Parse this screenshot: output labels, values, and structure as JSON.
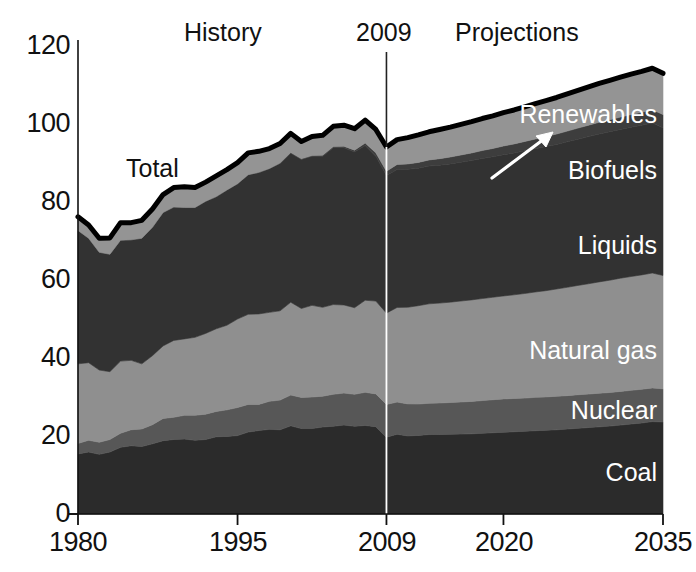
{
  "chart_data": {
    "type": "area",
    "title": "",
    "subtitle": "",
    "xlabel": "",
    "ylabel": "",
    "xlim": [
      1980,
      2035
    ],
    "ylim": [
      0,
      120
    ],
    "grid": false,
    "legend_position": "in-plot-right",
    "stacked": true,
    "x_ticks": [
      "1980",
      "1995",
      "2009",
      "2020",
      "2035"
    ],
    "x_tick_values": [
      1980,
      1995,
      2009,
      2020,
      2035
    ],
    "y_ticks": [
      "0",
      "20",
      "40",
      "60",
      "80",
      "100",
      "120"
    ],
    "y_tick_values": [
      0,
      20,
      40,
      60,
      80,
      100,
      120
    ],
    "annotations": [
      {
        "text": "History",
        "x": 1993,
        "y": 118
      },
      {
        "text": "2009",
        "x": 2009,
        "y": 118
      },
      {
        "text": "Projections",
        "x": 2020,
        "y": 118
      },
      {
        "text": "Total",
        "x": 1992,
        "y": 85
      }
    ],
    "divider_year": 2009,
    "series_order_bottom_to_top": [
      "Coal",
      "Nuclear",
      "Natural gas",
      "Liquids",
      "Biofuels",
      "Renewables"
    ],
    "x": [
      1980,
      1981,
      1982,
      1983,
      1984,
      1985,
      1986,
      1987,
      1988,
      1989,
      1990,
      1991,
      1992,
      1993,
      1994,
      1995,
      1996,
      1997,
      1998,
      1999,
      2000,
      2001,
      2002,
      2003,
      2004,
      2005,
      2006,
      2007,
      2008,
      2009,
      2010,
      2011,
      2012,
      2013,
      2014,
      2015,
      2016,
      2017,
      2018,
      2019,
      2020,
      2021,
      2022,
      2023,
      2024,
      2025,
      2026,
      2027,
      2028,
      2029,
      2030,
      2031,
      2032,
      2033,
      2034,
      2035
    ],
    "series": [
      {
        "name": "Coal",
        "color": "#2b2b2b",
        "values": [
          15.4,
          15.9,
          15.3,
          15.9,
          17.1,
          17.5,
          17.3,
          18.0,
          18.8,
          19.1,
          19.2,
          18.9,
          19.1,
          19.8,
          19.9,
          20.1,
          21.0,
          21.4,
          21.7,
          21.6,
          22.6,
          21.9,
          21.9,
          22.3,
          22.5,
          22.8,
          22.5,
          22.7,
          22.4,
          19.7,
          20.8,
          20.2,
          20.3,
          20.6,
          20.7,
          20.8,
          20.9,
          21.0,
          21.2,
          21.4,
          21.6,
          21.8,
          22.0,
          22.2,
          22.4,
          22.6,
          22.9,
          23.2,
          23.5,
          23.8,
          24.1,
          24.5,
          24.9,
          25.3,
          25.8,
          26.3
        ]
      },
      {
        "name": "Nuclear",
        "color": "#575757",
        "values": [
          2.7,
          3.0,
          3.1,
          3.2,
          3.6,
          4.1,
          4.5,
          4.9,
          5.7,
          5.7,
          6.1,
          6.4,
          6.5,
          6.5,
          6.8,
          7.2,
          7.1,
          6.7,
          7.2,
          7.6,
          7.9,
          8.0,
          8.1,
          7.9,
          8.2,
          8.2,
          8.2,
          8.5,
          8.4,
          8.4,
          8.4,
          8.3,
          8.1,
          8.1,
          8.2,
          8.3,
          8.4,
          8.5,
          8.6,
          8.7,
          8.8,
          8.8,
          8.8,
          8.9,
          8.9,
          9.0,
          9.0,
          9.1,
          9.1,
          9.2,
          9.2,
          9.3,
          9.3,
          9.4,
          9.4,
          9.5
        ]
      },
      {
        "name": "Natural gas",
        "color": "#8f8f8f",
        "values": [
          20.4,
          19.9,
          18.5,
          17.4,
          18.5,
          17.8,
          16.7,
          17.7,
          18.6,
          19.7,
          19.6,
          20.0,
          20.7,
          21.2,
          21.7,
          22.7,
          23.1,
          23.2,
          22.8,
          22.9,
          23.8,
          22.8,
          23.5,
          22.8,
          23.0,
          22.6,
          22.2,
          23.6,
          23.8,
          23.4,
          24.7,
          25.0,
          25.4,
          25.8,
          26.0,
          26.2,
          26.4,
          26.6,
          26.8,
          27.0,
          27.2,
          27.5,
          27.8,
          28.1,
          28.4,
          28.8,
          29.2,
          29.6,
          30.0,
          30.4,
          30.8,
          31.2,
          31.5,
          31.8,
          32.1,
          32.4
        ]
      },
      {
        "name": "Liquids",
        "color": "#323232",
        "values": [
          34.2,
          31.9,
          30.2,
          30.1,
          31.0,
          30.9,
          32.2,
          32.9,
          34.2,
          34.2,
          33.6,
          33.2,
          33.8,
          33.8,
          34.6,
          34.6,
          35.7,
          36.2,
          36.8,
          37.8,
          38.2,
          38.2,
          38.2,
          38.7,
          40.2,
          40.3,
          39.9,
          39.7,
          37.1,
          35.3,
          36.0,
          35.7,
          35.5,
          35.7,
          35.9,
          36.1,
          36.3,
          36.5,
          36.8,
          37.0,
          37.3,
          37.6,
          37.9,
          38.2,
          38.5,
          38.8,
          39.2,
          39.6,
          40.0,
          40.4,
          40.7,
          41.0,
          41.3,
          41.6,
          41.9,
          42.2
        ]
      },
      {
        "name": "Biofuels",
        "color": "#3d3d3d",
        "values": [
          0.0,
          0.0,
          0.0,
          0.0,
          0.0,
          0.0,
          0.0,
          0.0,
          0.0,
          0.0,
          0.1,
          0.1,
          0.1,
          0.1,
          0.1,
          0.1,
          0.1,
          0.1,
          0.1,
          0.1,
          0.2,
          0.2,
          0.2,
          0.3,
          0.3,
          0.4,
          0.5,
          0.6,
          0.9,
          1.1,
          1.3,
          1.4,
          1.5,
          1.6,
          1.7,
          1.8,
          1.9,
          2.0,
          2.1,
          2.2,
          2.3,
          2.4,
          2.5,
          2.6,
          2.7,
          2.8,
          2.9,
          3.0,
          3.1,
          3.2,
          3.3,
          3.4,
          3.5,
          3.6,
          3.7,
          3.8
        ]
      },
      {
        "name": "Renewables",
        "color": "#949494",
        "values": [
          3.5,
          3.4,
          3.6,
          4.2,
          4.5,
          4.4,
          4.6,
          4.7,
          4.6,
          5.0,
          5.3,
          5.1,
          4.9,
          5.3,
          5.2,
          5.4,
          5.6,
          5.4,
          5.1,
          5.0,
          4.9,
          4.4,
          4.9,
          5.1,
          5.2,
          5.4,
          5.5,
          5.9,
          6.0,
          6.2,
          6.5,
          6.8,
          7.1,
          7.3,
          7.6,
          7.8,
          8.0,
          8.2,
          8.4,
          8.6,
          8.8,
          9.0,
          9.2,
          9.4,
          9.6,
          9.8,
          10.0,
          10.2,
          10.4,
          10.6,
          10.8,
          11.0,
          11.2,
          11.4,
          11.6,
          11.8
        ]
      }
    ],
    "total_values": [
      76.2,
      74.1,
      70.7,
      70.8,
      74.7,
      74.7,
      75.3,
      78.2,
      81.9,
      83.7,
      83.9,
      83.7,
      85.1,
      86.7,
      88.3,
      90.1,
      92.6,
      93.0,
      93.7,
      95.0,
      97.6,
      95.5,
      96.8,
      97.1,
      99.4,
      99.7,
      98.8,
      101.0,
      98.6,
      94.1,
      97.7,
      97.4,
      97.9,
      99.1,
      100.1,
      101.0,
      101.9,
      102.8,
      103.9,
      104.9,
      106.0,
      107.1,
      108.2,
      109.4,
      110.5,
      111.8,
      113.2,
      114.7,
      116.1,
      117.6,
      118.9,
      120.4,
      121.7,
      123.1,
      124.5,
      126.0
    ],
    "total_display_values": [
      76.2,
      74.1,
      70.7,
      70.8,
      74.7,
      74.7,
      75.3,
      78.2,
      81.9,
      83.7,
      83.9,
      83.7,
      85.1,
      86.7,
      88.3,
      90.1,
      92.6,
      93.0,
      93.7,
      95.0,
      97.6,
      95.5,
      96.8,
      97.1,
      99.4,
      99.7,
      98.8,
      101.0,
      98.6,
      94.1,
      96.0,
      96.5,
      97.2,
      98.0,
      98.6,
      99.2,
      99.9,
      100.6,
      101.4,
      102.1,
      102.9,
      103.6,
      104.4,
      105.2,
      106.0,
      106.8,
      107.7,
      108.6,
      109.5,
      110.4,
      111.2,
      112.0,
      112.8,
      113.5,
      114.3,
      113.0
    ],
    "series_labels": [
      {
        "name": "Renewables",
        "text": "Renewables",
        "color_role": "light"
      },
      {
        "name": "Biofuels",
        "text": "Biofuels",
        "color_role": "light"
      },
      {
        "name": "Liquids",
        "text": "Liquids",
        "color_role": "light"
      },
      {
        "name": "Natural gas",
        "text": "Natural gas",
        "color_role": "light"
      },
      {
        "name": "Nuclear",
        "text": "Nuclear",
        "color_role": "light"
      },
      {
        "name": "Coal",
        "text": "Coal",
        "color_role": "light"
      }
    ]
  },
  "axis": {
    "y_labels": [
      "120",
      "100",
      "80",
      "60",
      "40",
      "20",
      "0"
    ],
    "x_labels": [
      "1980",
      "1995",
      "2009",
      "2020",
      "2035"
    ]
  },
  "labels": {
    "history": "History",
    "year_marker": "2009",
    "projections": "Projections",
    "total": "Total",
    "renewables": "Renewables",
    "biofuels": "Biofuels",
    "liquids": "Liquids",
    "natural_gas": "Natural gas",
    "nuclear": "Nuclear",
    "coal": "Coal"
  },
  "colors": {
    "coal": "#2b2b2b",
    "nuclear": "#575757",
    "natural_gas": "#8f8f8f",
    "liquids": "#323232",
    "biofuels": "#3d3d3d",
    "renewables": "#949494",
    "total_line": "#000000",
    "background": "#ffffff",
    "axis": "#111111",
    "divider": "#555555"
  }
}
